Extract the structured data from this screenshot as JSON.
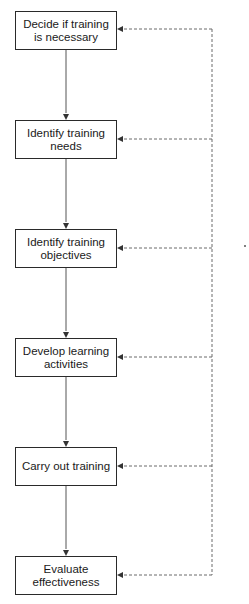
{
  "diagram": {
    "type": "flowchart",
    "steps": [
      {
        "id": 1,
        "label": "Decide if training is necessary"
      },
      {
        "id": 2,
        "label": "Identify training needs"
      },
      {
        "id": 3,
        "label": "Identify training objectives"
      },
      {
        "id": 4,
        "label": "Develop learning activities"
      },
      {
        "id": 5,
        "label": "Carry out training"
      },
      {
        "id": 6,
        "label": "Evaluate effectiveness"
      }
    ],
    "edges": {
      "solid_sequence": "step 1 → 2 → 3 → 4 → 5 → 6",
      "dashed_feedback": "loop from right side vertical line back into every step"
    },
    "colors": {
      "box_border": "#2a2a2a",
      "solid_arrow": "#444444",
      "dashed_feedback": "#666666",
      "background": "#ffffff"
    }
  }
}
